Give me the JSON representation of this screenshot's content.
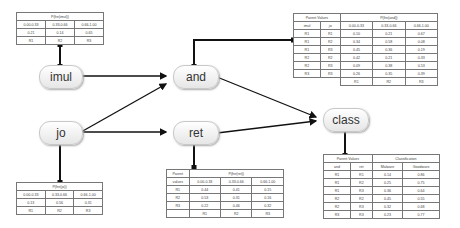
{
  "nodes": {
    "imul": "imul",
    "jo": "jo",
    "and": "and",
    "ret": "ret",
    "class": "class"
  },
  "imul_table": {
    "title": "P(fre(imul))",
    "ranges": [
      "0.00-0.33",
      "0.33-0.66",
      "0.66-1.00"
    ],
    "probs": [
      "0.21",
      "0.14",
      "0.65"
    ],
    "states": [
      "R1",
      "R2",
      "R3"
    ]
  },
  "jo_table": {
    "title": "P(fre(jo))",
    "ranges": [
      "0.00-0.33",
      "0.33-0.66",
      "0.66-1.00"
    ],
    "probs": [
      "0.13",
      "0.56",
      "0.31"
    ],
    "states": [
      "R1",
      "R2",
      "R3"
    ]
  },
  "and_table": {
    "parent_header": "Parent Values",
    "title": "P(fre(and))",
    "parents": [
      "imul",
      "jo"
    ],
    "ranges": [
      "0.00-0.33",
      "0.33-0.66",
      "0.66-1.00"
    ],
    "rows": [
      {
        "p1": "R1",
        "p2": "R1",
        "v": [
          "0.10",
          "0.21",
          "0.67"
        ]
      },
      {
        "p1": "R1",
        "p2": "R2",
        "v": [
          "0.34",
          "0.58",
          "0.08"
        ]
      },
      {
        "p1": "R1",
        "p2": "R3",
        "v": [
          "0.45",
          "0.36",
          "0.19"
        ]
      },
      {
        "p1": "R2",
        "p2": "R2",
        "v": [
          "0.42",
          "0.21",
          "0.33"
        ]
      },
      {
        "p1": "R2",
        "p2": "R3",
        "v": [
          "0.09",
          "0.38",
          "0.53"
        ]
      },
      {
        "p1": "R3",
        "p2": "R3",
        "v": [
          "0.26",
          "0.35",
          "0.39"
        ]
      }
    ],
    "states": [
      "R1",
      "R2",
      "R3"
    ]
  },
  "ret_table": {
    "parent_header_1": "Parent",
    "parent_header_2": "values",
    "title": "P(fre(ret))",
    "ranges": [
      "0.00-0.33",
      "0.33-0.66",
      "0.66-1.00"
    ],
    "rows": [
      {
        "p": "R1",
        "v": [
          "0.44",
          "0.41",
          "0.15"
        ]
      },
      {
        "p": "R2",
        "v": [
          "0.53",
          "0.31",
          "0.16"
        ]
      },
      {
        "p": "R3",
        "v": [
          "0.22",
          "0.46",
          "0.32"
        ]
      }
    ],
    "states": [
      "R1",
      "R2",
      "R3"
    ]
  },
  "class_table": {
    "parent_header": "Parent Values",
    "title": "Classification",
    "parents": [
      "and",
      "ret"
    ],
    "classes": [
      "Malware",
      "Goodware"
    ],
    "rows": [
      {
        "p1": "R1",
        "p2": "R1",
        "v": [
          "0.14",
          "0.86"
        ]
      },
      {
        "p1": "R1",
        "p2": "R2",
        "v": [
          "0.25",
          "0.75"
        ]
      },
      {
        "p1": "R1",
        "p2": "R3",
        "v": [
          "0.36",
          "0.64"
        ]
      },
      {
        "p1": "R2",
        "p2": "R2",
        "v": [
          "0.45",
          "0.55"
        ]
      },
      {
        "p1": "R2",
        "p2": "R3",
        "v": [
          "0.32",
          "0.68"
        ]
      },
      {
        "p1": "R3",
        "p2": "R3",
        "v": [
          "0.23",
          "0.77"
        ]
      }
    ]
  }
}
